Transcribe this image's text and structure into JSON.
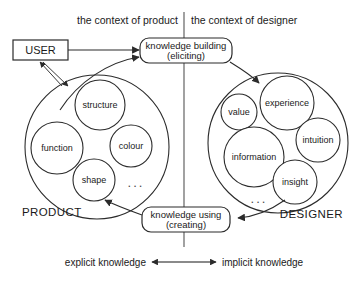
{
  "headers": {
    "left": "the context of product",
    "right": "the context of designer"
  },
  "nodes": {
    "user": "USER",
    "knowledge_building_line1": "knowledge building",
    "knowledge_building_line2": "(eliciting)",
    "knowledge_using_line1": "knowledge using",
    "knowledge_using_line2": "(creating)"
  },
  "product": {
    "label": "PRODUCT",
    "ellipsis": "...",
    "bubbles": [
      {
        "label": "structure",
        "cx": 100,
        "cy": 105,
        "r": 25
      },
      {
        "label": "function",
        "cx": 57,
        "cy": 148,
        "r": 26
      },
      {
        "label": "colour",
        "cx": 131,
        "cy": 146,
        "r": 21
      },
      {
        "label": "shape",
        "cx": 94,
        "cy": 180,
        "r": 21
      }
    ]
  },
  "designer": {
    "label": "DESIGNER",
    "ellipsis": "...",
    "bubbles": [
      {
        "label": "value",
        "cx": 239,
        "cy": 112,
        "r": 18
      },
      {
        "label": "experience",
        "cx": 287,
        "cy": 103,
        "r": 27
      },
      {
        "label": "intuition",
        "cx": 318,
        "cy": 140,
        "r": 22
      },
      {
        "label": "information",
        "cx": 254,
        "cy": 157,
        "r": 30
      },
      {
        "label": "insight",
        "cx": 295,
        "cy": 182,
        "r": 22
      }
    ]
  },
  "footer": {
    "left": "explicit knowledge",
    "right": "implicit knowledge"
  },
  "colors": {
    "ink": "#2b2b2b",
    "background": "#ffffff",
    "divider": "#555555"
  }
}
